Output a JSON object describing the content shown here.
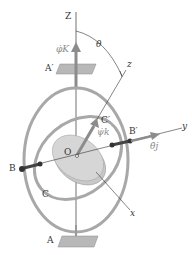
{
  "figure": {
    "labels": {
      "Z": "Z",
      "z": "z",
      "y": "y",
      "x": "x",
      "theta": "θ",
      "phi_dot_K": "φ̇K",
      "psi_dot_k": "ψ̇k",
      "theta_dot_j": "θ̇j",
      "A_prime": "A′",
      "A": "A",
      "B": "B",
      "B_prime": "B′",
      "C": "C",
      "C_prime": "C′",
      "O": "O"
    },
    "colors": {
      "ring": "#a8a8a8",
      "disk": "#c8c8c8",
      "axis": "#333333",
      "vector": "#8c8c8c",
      "plate": "#b8b8b8"
    }
  }
}
